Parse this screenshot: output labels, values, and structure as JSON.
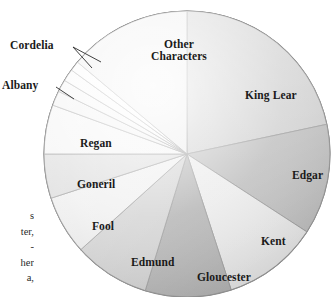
{
  "figure": {
    "kind": "pie-chart",
    "background": "#ffffff",
    "outline_color": "#8a8a8a",
    "label_color": "#1a1a1a"
  },
  "chart_data": {
    "type": "pie",
    "title": "",
    "subtitle": "",
    "xlabel": "",
    "ylabel": "",
    "legend_position": "none",
    "grid": false,
    "start_angle_deg": 0,
    "direction": "clockwise",
    "center": {
      "x": 187,
      "y": 154
    },
    "radius": 143,
    "units": "share of lines spoken",
    "labels": [
      "King Lear",
      "Edgar",
      "Kent",
      "Gloucester",
      "Edmund",
      "Fool",
      "Goneril",
      "Regan",
      "Albany",
      "Cordelia",
      "Other Characters"
    ],
    "slices": [
      {
        "label": "King Lear",
        "value": 21.7,
        "start_deg": 0.0,
        "end_deg": 78.0,
        "color": "#c9c9c9",
        "labeled_inside": true,
        "label_line_count": 1
      },
      {
        "label": "Edgar",
        "value": 12.5,
        "start_deg": 78.0,
        "end_deg": 123.0,
        "color": "#b4b4b4",
        "labeled_inside": true,
        "label_line_count": 1
      },
      {
        "label": "Kent",
        "value": 10.8,
        "start_deg": 123.0,
        "end_deg": 162.0,
        "color": "#e8e8e8",
        "labeled_inside": true,
        "label_line_count": 1
      },
      {
        "label": "Gloucester",
        "value": 9.7,
        "start_deg": 162.0,
        "end_deg": 197.0,
        "color": "#a8a8a8",
        "labeled_inside": true,
        "label_line_count": 1
      },
      {
        "label": "Edmund",
        "value": 8.6,
        "start_deg": 197.0,
        "end_deg": 228.0,
        "color": "#cccccc",
        "labeled_inside": true,
        "label_line_count": 1
      },
      {
        "label": "Fool",
        "value": 6.7,
        "start_deg": 228.0,
        "end_deg": 252.0,
        "color": "#ededed",
        "labeled_inside": true,
        "label_line_count": 1
      },
      {
        "label": "Goneril",
        "value": 5.0,
        "start_deg": 252.0,
        "end_deg": 270.0,
        "color": "#d6d6d6",
        "labeled_inside": true,
        "label_line_count": 1
      },
      {
        "label": "Regan",
        "value": 5.6,
        "start_deg": 270.0,
        "end_deg": 290.0,
        "color": "#f2f2f2",
        "labeled_inside": true,
        "label_line_count": 1
      },
      {
        "label": "Albany",
        "value": 1.7,
        "start_deg": 290.0,
        "end_deg": 296.0,
        "color": "#efefef",
        "labeled_inside": false,
        "label_line_count": 1
      },
      {
        "label": "",
        "value": 1.4,
        "start_deg": 296.0,
        "end_deg": 301.0,
        "color": "#f4f4f4",
        "labeled_inside": false,
        "label_line_count": 0
      },
      {
        "label": "Cordelia",
        "value": 1.4,
        "start_deg": 301.0,
        "end_deg": 306.0,
        "color": "#f7f7f7",
        "labeled_inside": false,
        "label_line_count": 1
      },
      {
        "label": "",
        "value": 1.1,
        "start_deg": 306.0,
        "end_deg": 310.0,
        "color": "#fafafa",
        "labeled_inside": false,
        "label_line_count": 0
      },
      {
        "label": "Other Characters",
        "value": 13.9,
        "start_deg": 310.0,
        "end_deg": 360.0,
        "color": "#eaeaea",
        "labeled_inside": true,
        "label_line_count": 2
      }
    ]
  },
  "inside_labels": [
    {
      "name": "king-lear",
      "text": "King Lear",
      "x": 245,
      "y": 89,
      "size": 11.5
    },
    {
      "name": "edgar",
      "text": "Edgar",
      "x": 292,
      "y": 169,
      "size": 11.5
    },
    {
      "name": "kent",
      "text": "Kent",
      "x": 261,
      "y": 235,
      "size": 11.5
    },
    {
      "name": "gloucester",
      "text": "Gloucester",
      "x": 197,
      "y": 271,
      "size": 11.5
    },
    {
      "name": "edmund",
      "text": "Edmund",
      "x": 131,
      "y": 256,
      "size": 11.5
    },
    {
      "name": "fool",
      "text": "Fool",
      "x": 92,
      "y": 220,
      "size": 11.5
    },
    {
      "name": "goneril",
      "text": "Goneril",
      "x": 77,
      "y": 178,
      "size": 11.5
    },
    {
      "name": "regan",
      "text": "Regan",
      "x": 80,
      "y": 137,
      "size": 11.5
    }
  ],
  "other_characters_label": {
    "name": "other-characters",
    "line1": "Other",
    "line2": "Characters",
    "x": 151,
    "y": 38,
    "size": 11.5
  },
  "callout_labels": [
    {
      "name": "cordelia",
      "text": "Cordelia",
      "x": 10,
      "y": 39,
      "size": 11.5,
      "leaders": [
        {
          "x1": 73,
          "y1": 47,
          "x2": 101,
          "y2": 62
        },
        {
          "x1": 73,
          "y1": 47,
          "x2": 92,
          "y2": 68
        }
      ]
    },
    {
      "name": "albany",
      "text": "Albany",
      "x": 2,
      "y": 79,
      "size": 11.5,
      "leaders": [
        {
          "x1": 56,
          "y1": 87,
          "x2": 74,
          "y2": 99
        }
      ]
    }
  ],
  "margin_body_text": {
    "name": "page-body-text-fragment",
    "lines": [
      "s",
      "ter,",
      "-",
      "her",
      "a,"
    ]
  }
}
